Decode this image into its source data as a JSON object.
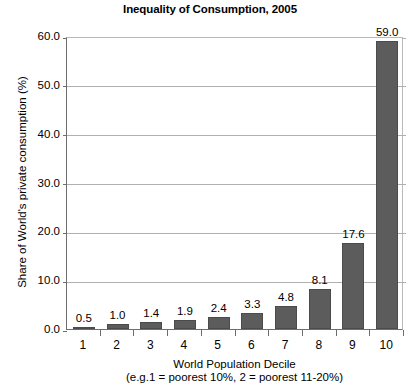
{
  "chart_data": {
    "type": "bar",
    "title": "Inequality of Consumption, 2005",
    "subtitle": "",
    "xlabel": "World Population Decile",
    "xlabel_note": "(e.g.1 = poorest 10%, 2 = poorest 11-20%)",
    "ylabel": "Share of World's private consumption (%)",
    "categories": [
      "1",
      "2",
      "3",
      "4",
      "5",
      "6",
      "7",
      "8",
      "9",
      "10"
    ],
    "values": [
      0.5,
      1.0,
      1.4,
      1.9,
      2.4,
      3.3,
      4.8,
      8.1,
      17.6,
      59.0
    ],
    "value_labels": [
      "0.5",
      "1.0",
      "1.4",
      "1.9",
      "2.4",
      "3.3",
      "4.8",
      "8.1",
      "17.6",
      "59.0"
    ],
    "ylim": [
      0,
      60
    ],
    "ytick_values": [
      0,
      10,
      20,
      30,
      40,
      50,
      60
    ],
    "ytick_labels": [
      "0.0",
      "10.0",
      "20.0",
      "30.0",
      "40.0",
      "50.0",
      "60.0"
    ],
    "grid": true,
    "legend": false,
    "legend_position": "none",
    "bar_color": "#5c5c5c",
    "gridline_color": "#b0b0b0",
    "axis_color": "#6e6e6e",
    "background_color": "#ffffff"
  }
}
